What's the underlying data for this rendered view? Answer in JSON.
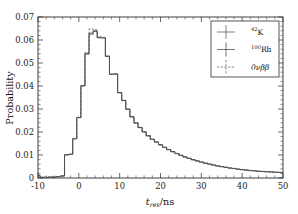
{
  "figure": {
    "background_color": "#ffffff",
    "frame_color": "#2b2b2b",
    "width": 298,
    "height": 214
  },
  "axes": {
    "y_title": "Probability",
    "x_title_main": "t",
    "x_title_sub": "res",
    "x_title_unit": "/ns",
    "x_ticklabels": [
      "-10",
      "0",
      "10",
      "20",
      "30",
      "40",
      "50"
    ],
    "y_ticklabels": [
      "0",
      "0.01",
      "0.02",
      "0.03",
      "0.04",
      "0.05",
      "0.06",
      "0.07"
    ]
  },
  "legend": {
    "position": "top-right",
    "entries": [
      {
        "id": "k42",
        "label_mass": "42",
        "label_element": "K",
        "marker": "errorbar-cross-marker",
        "linestyle": "solid",
        "color": "#4d4d4d"
      },
      {
        "id": "rh100",
        "label_mass": "100",
        "label_element": "Rh",
        "marker": "errorbar-cross-marker",
        "linestyle": "solid",
        "color": "#3a3a3a"
      },
      {
        "id": "bb0nu",
        "label_mass": "",
        "label_element": "0νββ",
        "marker": "errorbar-cross-marker",
        "linestyle": "dashed",
        "color": "#555555"
      }
    ]
  },
  "chart_data": {
    "type": "line",
    "title": "",
    "subtitle": "",
    "xlabel": "t_res/ns",
    "ylabel": "Probability",
    "xlim": [
      -10,
      50
    ],
    "ylim": [
      0,
      0.07
    ],
    "x_major_tick_step": 10,
    "x_minor_tick_step": 2,
    "y_major_tick_step": 0.01,
    "y_minor_tick_step": 0.002,
    "grid": false,
    "legend_position": "top-right",
    "histogram_style": "step",
    "bin_width": 1,
    "x": [
      -10,
      -9,
      -8,
      -7,
      -6,
      -5,
      -4,
      -3,
      -2,
      -1,
      0,
      1,
      2,
      3,
      4,
      5,
      6,
      7,
      8,
      9,
      10,
      11,
      12,
      13,
      14,
      15,
      16,
      17,
      18,
      19,
      20,
      21,
      22,
      23,
      24,
      25,
      26,
      27,
      28,
      29,
      30,
      31,
      32,
      33,
      34,
      35,
      36,
      37,
      38,
      39,
      40,
      41,
      42,
      43,
      44,
      45,
      46,
      47,
      48,
      49,
      50
    ],
    "series": [
      {
        "name": "42K",
        "color": "#4d4d4d",
        "linestyle": "solid",
        "values": [
          0.0012,
          0.0003,
          0.0003,
          0.0004,
          0.0004,
          0.0006,
          0.0009,
          0.0102,
          0.0104,
          0.0172,
          0.0264,
          0.0402,
          0.0538,
          0.0625,
          0.0637,
          0.0609,
          0.0609,
          0.0528,
          0.045,
          0.0451,
          0.037,
          0.0336,
          0.0298,
          0.0265,
          0.0238,
          0.0219,
          0.02,
          0.0183,
          0.0168,
          0.0156,
          0.0144,
          0.0133,
          0.0123,
          0.0114,
          0.0106,
          0.0098,
          0.0091,
          0.0085,
          0.0079,
          0.0074,
          0.0069,
          0.0064,
          0.006,
          0.0056,
          0.0052,
          0.0049,
          0.0046,
          0.0043,
          0.0041,
          0.0038,
          0.0036,
          0.0034,
          0.0032,
          0.0031,
          0.0029,
          0.0028,
          0.0027,
          0.0026,
          0.0025,
          0.0024,
          0.0023
        ]
      },
      {
        "name": "100Rh",
        "color": "#3a3a3a",
        "linestyle": "solid",
        "values": [
          0.001,
          0.0003,
          0.0003,
          0.0004,
          0.0004,
          0.0006,
          0.0009,
          0.01,
          0.0102,
          0.017,
          0.0262,
          0.04,
          0.0542,
          0.063,
          0.064,
          0.0612,
          0.061,
          0.053,
          0.0452,
          0.0453,
          0.0372,
          0.0338,
          0.03,
          0.0267,
          0.024,
          0.022,
          0.0201,
          0.0184,
          0.0169,
          0.0157,
          0.0145,
          0.0134,
          0.0124,
          0.0115,
          0.0107,
          0.0099,
          0.0092,
          0.0086,
          0.008,
          0.0075,
          0.007,
          0.0065,
          0.0061,
          0.0057,
          0.0053,
          0.005,
          0.0047,
          0.0044,
          0.0042,
          0.0039,
          0.0037,
          0.0035,
          0.0033,
          0.0032,
          0.003,
          0.0029,
          0.0028,
          0.0027,
          0.0026,
          0.0025,
          0.0024
        ]
      },
      {
        "name": "0nubb",
        "color": "#555555",
        "linestyle": "dashed",
        "values": [
          0.0011,
          0.0003,
          0.0003,
          0.0004,
          0.0004,
          0.0006,
          0.0009,
          0.0101,
          0.0103,
          0.0171,
          0.0263,
          0.0401,
          0.0545,
          0.0648,
          0.0644,
          0.0614,
          0.0611,
          0.0531,
          0.0451,
          0.0452,
          0.0371,
          0.0337,
          0.0299,
          0.0266,
          0.0239,
          0.0219,
          0.02,
          0.0183,
          0.0168,
          0.0156,
          0.0144,
          0.0133,
          0.0123,
          0.0114,
          0.0106,
          0.0098,
          0.0091,
          0.0085,
          0.0079,
          0.0074,
          0.0069,
          0.0064,
          0.006,
          0.0056,
          0.0052,
          0.0049,
          0.0046,
          0.0043,
          0.0041,
          0.0038,
          0.0036,
          0.0034,
          0.0032,
          0.0031,
          0.0029,
          0.0028,
          0.0027,
          0.0026,
          0.0025,
          0.0024,
          0.0023
        ]
      }
    ]
  }
}
